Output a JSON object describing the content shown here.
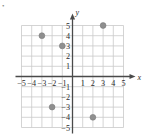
{
  "chart_data": {
    "type": "scatter",
    "title": "",
    "xlabel": "x",
    "ylabel": "y",
    "xlim": [
      -5.5,
      5.5
    ],
    "ylim": [
      -5.5,
      5.5
    ],
    "grid": true,
    "legend": null,
    "x_ticks": [
      -5,
      -4,
      -3,
      -2,
      -1,
      1,
      2,
      3,
      4,
      5
    ],
    "y_ticks": [
      5,
      4,
      3,
      2,
      1,
      -1,
      -2,
      -3,
      -4,
      -5
    ],
    "x_tick_labels": [
      "−5",
      "−4",
      "−3",
      "−2",
      "−1",
      "1",
      "2",
      "3",
      "4",
      "5"
    ],
    "y_tick_labels": [
      "5",
      "4",
      "3",
      "2",
      "1",
      "−1",
      "−2",
      "−3",
      "−4",
      "−5"
    ],
    "points": [
      {
        "x": -3,
        "y": 4,
        "label": "(−3, 4)"
      },
      {
        "x": -1,
        "y": 3,
        "label": "(−1, 3)"
      },
      {
        "x": 3,
        "y": 5,
        "label": "(3, 5)"
      },
      {
        "x": -2,
        "y": -3,
        "label": "(−2, −3)"
      },
      {
        "x": 2,
        "y": -4,
        "label": "(2, −4)"
      }
    ]
  },
  "axes": {
    "x_axis_name": "x",
    "y_axis_name": "y"
  },
  "colors": {
    "background": "#ffffff",
    "grid": "#c9c9c9",
    "axis": "#4a4a4a",
    "point": "#8f8f8f",
    "point_edge": "#7a7a7a",
    "label": "#2b2b2b"
  },
  "marks": {
    "top_left_corner": "•"
  }
}
